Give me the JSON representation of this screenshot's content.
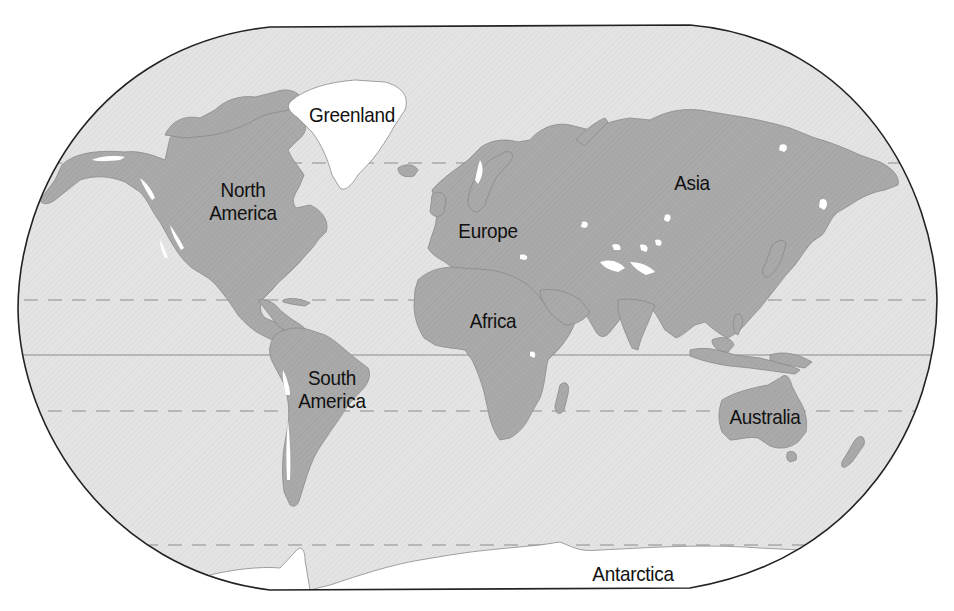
{
  "map": {
    "type": "world-physical-relief",
    "projection": "Robinson-like rounded frame",
    "colors": {
      "ocean": "#e3e3e3",
      "land": "#a9a9a9",
      "land_outline": "#8a8a8a",
      "ice_highland": "#ffffff",
      "frame": "#222222",
      "latitude_line": "#8c8c8c",
      "background": "#ffffff"
    },
    "latitude_lines": [
      {
        "name": "Arctic Circle",
        "style": "dashed",
        "y": 163
      },
      {
        "name": "Tropic of Cancer",
        "style": "dashed",
        "y": 300
      },
      {
        "name": "Equator",
        "style": "solid",
        "y": 355
      },
      {
        "name": "Tropic of Capricorn",
        "style": "dashed",
        "y": 411
      },
      {
        "name": "Antarctic Circle",
        "style": "dashed",
        "y": 545
      }
    ],
    "labels": {
      "greenland": "Greenland",
      "north_america": "North\nAmerica",
      "europe": "Europe",
      "asia": "Asia",
      "africa": "Africa",
      "south_america": "South\nAmerica",
      "australia": "Australia",
      "antarctica": "Antarctica"
    }
  }
}
